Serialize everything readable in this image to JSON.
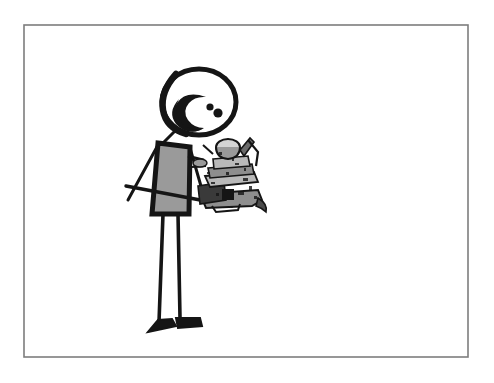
{
  "image": {
    "kind": "hand-drawn-cartoon-illustration",
    "title": "Stick figure carrying a cluttered tray",
    "width": 494,
    "height": 383,
    "background_color": "#ffffff",
    "caption": ""
  },
  "frame": {
    "name": "picture-border",
    "stroke_color": "#7d7d7d",
    "stroke_width": 1.6,
    "fill": "#ffffff",
    "x": 24,
    "y": 25,
    "width": 444,
    "height": 332
  },
  "palette": {
    "ink_black": "#151515",
    "ink_soft": "#2a2a2a",
    "garment_gray": "#9a9a9a",
    "garment_gray_dark": "#8a8a8a",
    "object_gray_light": "#b9b9b9",
    "object_gray_mid": "#8e8e8e",
    "object_gray_dark": "#5a5a5a",
    "paper_white": "#ffffff",
    "frame_gray": "#7d7d7d"
  },
  "figure": {
    "name": "stick-figure",
    "head": {
      "name": "head",
      "shape": "oval",
      "center_x": 199,
      "center_y": 102,
      "radius_x": 37,
      "radius_y": 33,
      "outline_color": "#151515",
      "outline_width": 5,
      "fill": "#ffffff",
      "features": {
        "crescent_label": "large comma / crescent shading inside the head",
        "crescent_color": "#151515",
        "eye_count": 2,
        "eye_color": "#151515",
        "eye_1": {
          "cx": 210,
          "cy": 107,
          "r": 3.6
        },
        "eye_2": {
          "cx": 218,
          "cy": 113,
          "r": 4.6
        }
      }
    },
    "neck": {
      "name": "neck",
      "x1": 176,
      "y1": 130,
      "x2": 163,
      "y2": 143,
      "color": "#151515",
      "width": 3
    },
    "torso": {
      "name": "torso",
      "shape": "tapered-quadrilateral",
      "fill": "#9a9a9a",
      "outline_color": "#151515",
      "outline_width": 5,
      "points": "158,143 190,147 189,214 152,214"
    },
    "arms": [
      {
        "name": "left-arm",
        "description": "thin arm angling down and to the left from the shoulder",
        "path": "M158,145 L128,200",
        "color": "#151515",
        "width": 3
      },
      {
        "name": "right-arm",
        "description": "thin arm angling down and to the right toward the tray",
        "path": "M190,148 L205,200",
        "color": "#151515",
        "width": 3
      },
      {
        "name": "forearm-bar",
        "description": "long near-horizontal forearm / tray support line crossing the torso",
        "path": "M126,186 L232,206",
        "color": "#151515",
        "width": 3.4
      }
    ],
    "legs": [
      {
        "name": "left-leg",
        "path": "M163,214 L159,322",
        "color": "#151515",
        "width": 3.6
      },
      {
        "name": "right-leg",
        "path": "M178,214 L180,318",
        "color": "#151515",
        "width": 3.6
      }
    ],
    "feet": [
      {
        "name": "left-foot",
        "description": "black wedge pointing left",
        "points": "148,332 176,326 172,319 158,320",
        "color": "#151515"
      },
      {
        "name": "right-foot",
        "description": "black wedge pointing right",
        "points": "176,318 200,318 202,326 178,328",
        "color": "#151515"
      }
    ]
  },
  "carried_object": {
    "name": "loaded-tray",
    "description": "Dense cluster of pots, dishes, cups and utensils stacked and piled on a tray held in the figure's right hand",
    "bounds": {
      "x": 196,
      "y": 138,
      "width": 76,
      "height": 74
    },
    "dominant_colors": [
      "#151515",
      "#8e8e8e",
      "#b9b9b9",
      "#5a5a5a",
      "#ffffff"
    ],
    "parts": [
      {
        "name": "top-pot",
        "label": "rounded pot or kettle at the very top"
      },
      {
        "name": "upright-handle",
        "label": "thin angled handle rising to the upper right"
      },
      {
        "name": "stacked-bowls",
        "label": "stack of wide shallow bowls in the middle"
      },
      {
        "name": "tray-plate",
        "label": "wide flat tray plate near the bottom"
      },
      {
        "name": "side-box",
        "label": "dark boxy container on the lower left"
      },
      {
        "name": "utensils",
        "label": "thin utensils sticking out to the left"
      },
      {
        "name": "spout",
        "label": "curved spout projecting to the lower right"
      }
    ]
  }
}
